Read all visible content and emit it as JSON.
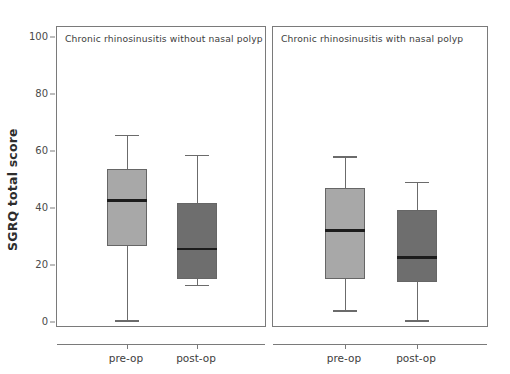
{
  "chart_data": {
    "type": "box",
    "title": "",
    "ylabel": "SGRQ total score",
    "xlabel": "",
    "ylim": [
      0,
      105
    ],
    "yticks": [
      0,
      20,
      40,
      60,
      80,
      100
    ],
    "grid": false,
    "legend": "none",
    "categories": [
      "pre-op",
      "post-op"
    ],
    "panels": [
      {
        "title": "Chronic rhinosinusitis without nasal polyp",
        "boxes": [
          {
            "label": "pre-op",
            "color": "#a8a8a8",
            "whisker_low": 1,
            "q1": 27,
            "median": 43,
            "q3": 54,
            "whisker_high": 66
          },
          {
            "label": "post-op",
            "color": "#6e6e6e",
            "whisker_low": 13.5,
            "q1": 15.5,
            "median": 26,
            "q3": 42,
            "whisker_high": 59
          }
        ]
      },
      {
        "title": "Chronic rhinosinusitis with nasal polyp",
        "boxes": [
          {
            "label": "pre-op",
            "color": "#a8a8a8",
            "whisker_low": 4.5,
            "q1": 15.5,
            "median": 32.5,
            "q3": 47.5,
            "whisker_high": 58.5
          },
          {
            "label": "post-op",
            "color": "#6e6e6e",
            "whisker_low": 1,
            "q1": 14.5,
            "median": 23,
            "q3": 39.5,
            "whisker_high": 49.5
          }
        ]
      }
    ]
  },
  "colors": {
    "preop_fill": "#a8a8a8",
    "postop_fill": "#6e6e6e",
    "box_border": "#666666",
    "median_line": "#1c1c1c",
    "whisker": "#6b6b6b",
    "frame": "#7a7a7a",
    "text": "#3d3d3d",
    "background": "#ffffff"
  }
}
